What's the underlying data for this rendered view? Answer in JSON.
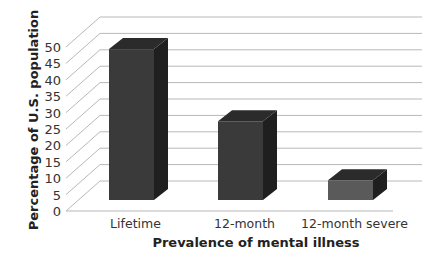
{
  "chart_data": {
    "type": "bar",
    "style": "3d-column",
    "title": "",
    "xlabel": "Prevalence of mental illness",
    "ylabel": "Percentage of U.S. population",
    "categories": [
      "Lifetime",
      "12-month",
      "12-month severe"
    ],
    "values": [
      46,
      24,
      6
    ],
    "ylim": [
      0,
      50
    ],
    "yticks": [
      0,
      5,
      10,
      15,
      20,
      25,
      30,
      35,
      40,
      45,
      50
    ],
    "grid": true,
    "legend": null,
    "colors": {
      "bar_front": "#3a3a3a",
      "bar_side": "#1f1f1f",
      "bar_top": "#2b2b2b",
      "bar_front_light": "#5a5a5a",
      "gridline": "#b8b8b8"
    }
  }
}
